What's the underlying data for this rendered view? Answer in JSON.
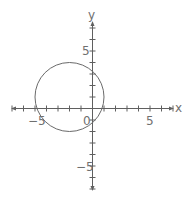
{
  "chart_data": {
    "type": "line",
    "title": "",
    "xlabel": "x",
    "ylabel": "y",
    "xlim": [
      -7,
      7
    ],
    "ylim": [
      -7,
      7
    ],
    "grid": false,
    "x_tick_labels": [
      {
        "value": -5,
        "label": "−5"
      },
      {
        "value": 0,
        "label": "0"
      },
      {
        "value": 5,
        "label": "5"
      }
    ],
    "y_tick_labels": [
      {
        "value": 5,
        "label": "5"
      },
      {
        "value": -5,
        "label": "−5"
      }
    ],
    "tick_step": 1,
    "series": [
      {
        "name": "circle",
        "shape": "circle",
        "equation": "(x+2)^2 + (y-1)^2 = 9",
        "center": [
          -2,
          1
        ],
        "radius": 3
      }
    ]
  },
  "axes": {
    "x_label": "x",
    "y_label": "y",
    "origin_label": "0",
    "x_neg5_label": "−5",
    "x_pos5_label": "5",
    "y_pos5_label": "5",
    "y_neg5_label": "−5"
  },
  "colors": {
    "axis": "#5f5f5f",
    "curve": "#6a6a6a",
    "text": "#6f6f6f"
  }
}
